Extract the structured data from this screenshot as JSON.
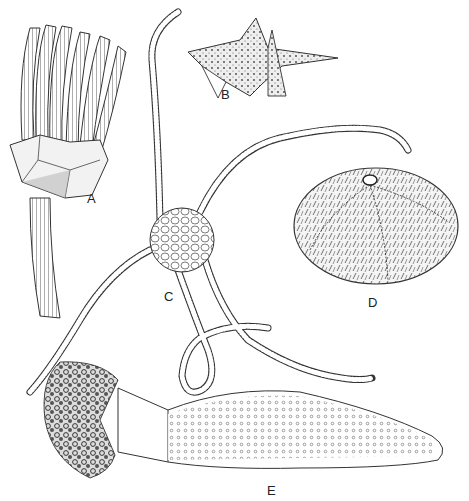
{
  "figure": {
    "labels": [
      {
        "id": "A",
        "text": "A",
        "x": 87,
        "y": 192,
        "subject": "crinoid (sea lily)"
      },
      {
        "id": "B",
        "text": "B",
        "x": 221,
        "y": 88,
        "subject": "sea star"
      },
      {
        "id": "C",
        "text": "C",
        "x": 164,
        "y": 290,
        "subject": "brittle star"
      },
      {
        "id": "D",
        "text": "D",
        "x": 368,
        "y": 296,
        "subject": "sea urchin"
      },
      {
        "id": "E",
        "text": "E",
        "x": 267,
        "y": 484,
        "subject": "sea cucumber"
      }
    ],
    "colors": {
      "ink": "#2a2a2a",
      "paper": "#ffffff",
      "shade": "#9a9a9a"
    }
  }
}
